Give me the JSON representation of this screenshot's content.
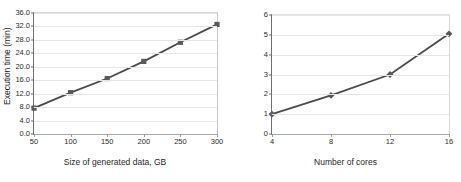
{
  "figure": {
    "background": "#ffffff",
    "line_color": "#4a4a4a",
    "marker_color": "#595959",
    "grid_color": "#e6e6e6"
  },
  "chart_data": [
    {
      "type": "line",
      "title": "",
      "xlabel": "Size of generated data, GB",
      "ylabel": "Execution time (min)",
      "x": [
        50,
        100,
        150,
        200,
        250,
        300
      ],
      "values": [
        7.7,
        12.3,
        16.5,
        21.6,
        27.3,
        32.6
      ],
      "xticklabels": [
        "50",
        "100",
        "150",
        "200",
        "250",
        "300"
      ],
      "yticklabels": [
        "0.0",
        "4.0",
        "8.0",
        "12.0",
        "16.0",
        "20.0",
        "24.0",
        "28.0",
        "32.0",
        "36.0"
      ],
      "yticks": [
        0,
        4,
        8,
        12,
        16,
        20,
        24,
        28,
        32,
        36
      ],
      "xlim": [
        50,
        300
      ],
      "ylim": [
        0,
        36
      ],
      "grid": true,
      "legend": "none",
      "marker": "square"
    },
    {
      "type": "line",
      "title": "",
      "xlabel": "Number of cores",
      "ylabel": "Speedup",
      "x": [
        4,
        8,
        12,
        16
      ],
      "values": [
        1.0,
        1.95,
        3.0,
        5.05
      ],
      "xticklabels": [
        "4",
        "8",
        "12",
        "16"
      ],
      "yticklabels": [
        "0",
        "1",
        "2",
        "3",
        "4",
        "5",
        "6"
      ],
      "yticks": [
        0,
        1,
        2,
        3,
        4,
        5,
        6
      ],
      "xlim": [
        4,
        16
      ],
      "ylim": [
        0,
        6
      ],
      "grid": true,
      "legend": "none",
      "marker": "diamond"
    }
  ]
}
